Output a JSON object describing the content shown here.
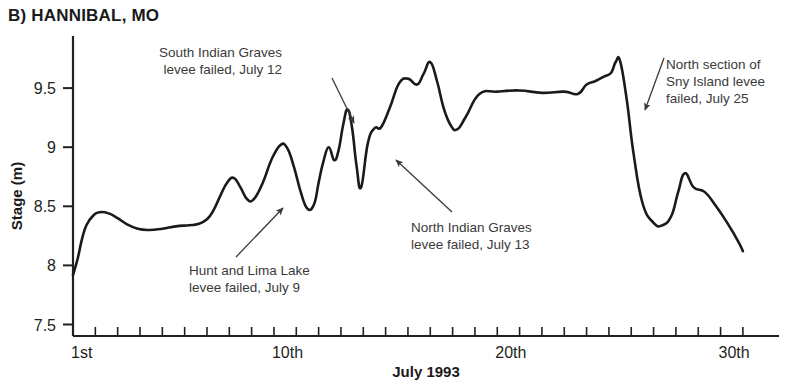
{
  "panel": {
    "title": "B) HANNIBAL, MO"
  },
  "chart_data": {
    "type": "line",
    "title": "B) HANNIBAL, MO",
    "xlabel": "July 1993",
    "ylabel": "Stage (m)",
    "xlim": [
      1,
      31
    ],
    "ylim": [
      7.5,
      9.8
    ],
    "yticks": [
      7.5,
      8,
      8.5,
      9,
      9.5
    ],
    "ytick_labels": [
      "7.5",
      "8",
      "8.5",
      "9",
      "9.5"
    ],
    "xticks": [
      1,
      2,
      3,
      4,
      5,
      6,
      7,
      8,
      9,
      10,
      11,
      12,
      13,
      14,
      15,
      16,
      17,
      18,
      19,
      20,
      21,
      22,
      23,
      24,
      25,
      26,
      27,
      28,
      29,
      30,
      31
    ],
    "xtick_labels": [
      {
        "x": 1,
        "label": "1st"
      },
      {
        "x": 10,
        "label": "10th"
      },
      {
        "x": 20,
        "label": "20th"
      },
      {
        "x": 30,
        "label": "30th"
      }
    ],
    "grid": false,
    "legend": "none",
    "series": [
      {
        "name": "Stage",
        "color": "#1a1a1a",
        "x": [
          1.0,
          1.2,
          1.4,
          1.6,
          1.9,
          2.2,
          2.6,
          3.0,
          3.4,
          3.9,
          4.4,
          5.0,
          5.6,
          6.2,
          6.6,
          7.0,
          7.3,
          7.6,
          7.9,
          8.2,
          8.5,
          8.8,
          9.1,
          9.5,
          9.9,
          10.3,
          10.6,
          10.9,
          11.2,
          11.5,
          11.8,
          12.0,
          12.2,
          12.45,
          12.7,
          12.9,
          13.1,
          13.3,
          13.5,
          13.7,
          13.9,
          14.2,
          14.5,
          14.8,
          15.2,
          15.6,
          16.0,
          16.4,
          16.7,
          17.0,
          17.3,
          17.6,
          17.9,
          18.2,
          18.6,
          19.2,
          20.0,
          21.0,
          22.0,
          23.0,
          23.6,
          24.0,
          24.4,
          24.8,
          25.1,
          25.3,
          25.5,
          25.8,
          26.1,
          26.5,
          27.0,
          27.4,
          27.8,
          28.1,
          28.4,
          28.8,
          29.3,
          29.8,
          30.3,
          30.8,
          31.0
        ],
        "y": [
          7.92,
          8.05,
          8.22,
          8.34,
          8.42,
          8.45,
          8.44,
          8.4,
          8.35,
          8.31,
          8.3,
          8.31,
          8.33,
          8.34,
          8.35,
          8.39,
          8.47,
          8.59,
          8.7,
          8.74,
          8.66,
          8.56,
          8.56,
          8.7,
          8.9,
          9.02,
          8.99,
          8.83,
          8.62,
          8.48,
          8.52,
          8.7,
          8.87,
          9.0,
          8.89,
          8.98,
          9.19,
          9.32,
          9.16,
          8.84,
          8.66,
          9.03,
          9.16,
          9.17,
          9.34,
          9.54,
          9.58,
          9.53,
          9.62,
          9.72,
          9.56,
          9.33,
          9.19,
          9.15,
          9.26,
          9.45,
          9.47,
          9.48,
          9.46,
          9.47,
          9.45,
          9.53,
          9.56,
          9.6,
          9.63,
          9.72,
          9.73,
          9.4,
          8.95,
          8.53,
          8.36,
          8.34,
          8.42,
          8.62,
          8.78,
          8.66,
          8.62,
          8.5,
          8.36,
          8.2,
          8.12
        ]
      }
    ],
    "annotations": [
      {
        "id": "south-indian-graves",
        "lines": [
          "South Indian Graves",
          "levee failed, July 12"
        ],
        "text_x": 282,
        "text_y": 57,
        "align": "end",
        "arrow": {
          "x1": 332,
          "y1": 78,
          "x2": 354,
          "y2": 123
        }
      },
      {
        "id": "north-section-sny-island",
        "lines": [
          "North section of",
          "Sny Island levee",
          "failed, July 25"
        ],
        "text_x": 666,
        "text_y": 69,
        "align": "start",
        "arrow": {
          "x1": 664,
          "y1": 58,
          "x2": 645,
          "y2": 110
        }
      },
      {
        "id": "north-indian-graves",
        "lines": [
          "North Indian Graves",
          "levee failed, July 13"
        ],
        "text_x": 411,
        "text_y": 232,
        "align": "start",
        "arrow": {
          "x1": 452,
          "y1": 212,
          "x2": 396,
          "y2": 160
        }
      },
      {
        "id": "hunt-and-lima-lake",
        "lines": [
          "Hunt and Lima Lake",
          "levee failed, July 9"
        ],
        "text_x": 189,
        "text_y": 275,
        "align": "start",
        "arrow": {
          "x1": 236,
          "y1": 257,
          "x2": 283,
          "y2": 208
        }
      }
    ]
  }
}
